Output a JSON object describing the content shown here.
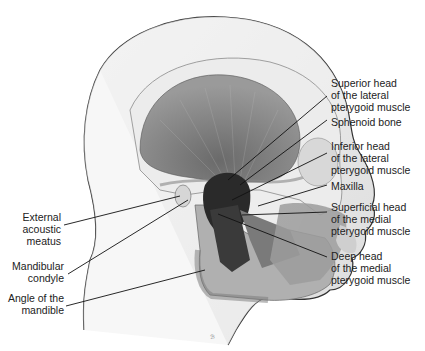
{
  "figure": {
    "signature": "ℬ"
  },
  "labels_right": [
    {
      "id": "superior-head-lateral-pterygoid",
      "lines": [
        "Superior head",
        "of the lateral",
        "pterygoid muscle"
      ]
    },
    {
      "id": "sphenoid-bone",
      "lines": [
        "Sphenoid bone"
      ]
    },
    {
      "id": "inferior-head-lateral-pterygoid",
      "lines": [
        "Inferior head",
        "of the lateral",
        "pterygoid muscle"
      ]
    },
    {
      "id": "maxilla",
      "lines": [
        "Maxilla"
      ]
    },
    {
      "id": "superficial-head-medial-pterygoid",
      "lines": [
        "Superficial head",
        "of the medial",
        "pterygoid muscle"
      ]
    },
    {
      "id": "deep-head-medial-pterygoid",
      "lines": [
        "Deep head",
        "of the medial",
        "pterygoid muscle"
      ]
    }
  ],
  "labels_left": [
    {
      "id": "external-acoustic-meatus",
      "lines": [
        "External",
        "acoustic",
        "meatus"
      ]
    },
    {
      "id": "mandibular-condyle",
      "lines": [
        "Mandibular",
        "condyle"
      ]
    },
    {
      "id": "angle-of-mandible",
      "lines": [
        "Angle of the",
        "mandible"
      ]
    }
  ]
}
